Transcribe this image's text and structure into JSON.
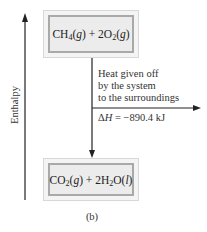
{
  "diagram": {
    "axis_label": "Enthalpy",
    "reactants": {
      "label": "CH4(g) + 2O2(g)",
      "parts": [
        "CH",
        "4",
        "(",
        "g",
        ") + 2O",
        "2",
        "(",
        "g",
        ")"
      ]
    },
    "products": {
      "label": "CO2(g) + 2H2O(l)",
      "parts": [
        "CO",
        "2",
        "(",
        "g",
        ") + 2H",
        "2",
        "O(",
        "l",
        ")"
      ]
    },
    "heat_note": {
      "line1": "Heat given off",
      "line2": "by the system",
      "line3": "to the surroundings"
    },
    "delta_h": {
      "symbol": "ΔH",
      "equals": " = −890.4 kJ",
      "value": -890.4,
      "unit": "kJ"
    },
    "caption": "(b)",
    "colors": {
      "box_fill": "#ececec",
      "box_border": "#a9a9a9",
      "line": "#222222"
    }
  }
}
